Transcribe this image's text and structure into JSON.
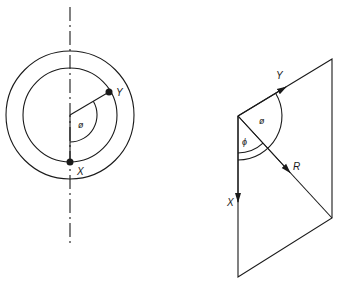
{
  "left_figure": {
    "labels": {
      "point_y": "Y",
      "point_x": "X",
      "angle": "ø"
    },
    "center": [
      70,
      115
    ],
    "outer_radius": 64,
    "inner_radius": 47
  },
  "right_figure": {
    "labels": {
      "vector_y": "Y",
      "vector_x": "X",
      "vector_r": "R",
      "angle_theta": "ø",
      "angle_phi": "ϕ"
    },
    "vertices": {
      "origin": [
        238,
        116
      ],
      "top_right": [
        332,
        59
      ],
      "bottom_right": [
        332,
        218
      ],
      "bottom_left": [
        238,
        277
      ]
    }
  },
  "colors": {
    "ink": "#1a1a1a",
    "background": "#ffffff"
  }
}
